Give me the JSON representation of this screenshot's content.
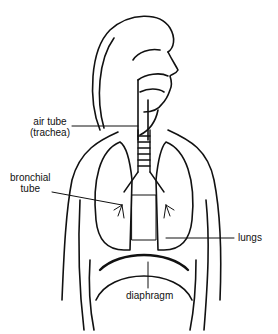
{
  "diagram": {
    "labels": {
      "air_tube_line1": "air tube",
      "air_tube_line2": "(trachea)",
      "bronchial_line1": "bronchial",
      "bronchial_line2": "tube",
      "lungs": "lungs",
      "diaphragm": "diaphragm"
    },
    "colors": {
      "ink": "#111111",
      "background": "#ffffff"
    }
  }
}
